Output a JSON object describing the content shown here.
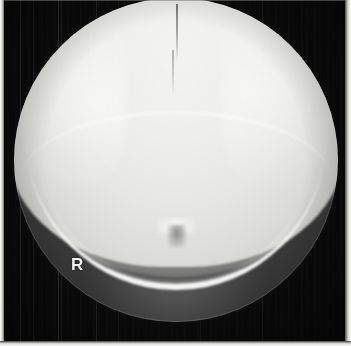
{
  "image": {
    "type": "radiograph",
    "modality": "X-ray",
    "view_description": "Skull radiograph, occipital / Towne's projection showing calvarium, posterior fossa and foramen magnum within a circular collimated field",
    "width_px": 351,
    "height_px": 346
  },
  "markers": {
    "laterality": {
      "label": "R",
      "meaning": "right-side-marker",
      "color": "#f2f2f2",
      "x_px": 78,
      "y_px": 268
    }
  },
  "field": {
    "collimation_shape": "circle",
    "center_x_px": 176,
    "center_y_px": 160,
    "radius_px": 162
  },
  "tones": {
    "background": "#0b0b0b",
    "film_edge": "#d9d9d6",
    "calvarium_bright": "#eeeeec",
    "posterior_fossa_mid": "#8a8a88",
    "lucency_dark": "#5a5a58",
    "bone_highlight": "#ffffff"
  },
  "anatomy": {
    "regions": [
      {
        "name": "calvarium",
        "label": "Cranial vault"
      },
      {
        "name": "sagittal-suture",
        "label": "Sagittal suture"
      },
      {
        "name": "posterior-fossa",
        "label": "Posterior fossa"
      },
      {
        "name": "foramen-magnum",
        "label": "Foramen magnum"
      },
      {
        "name": "petrous-ridge-left",
        "label": "Left petrous ridge"
      },
      {
        "name": "petrous-ridge-right",
        "label": "Right petrous ridge"
      },
      {
        "name": "occipital-arc",
        "label": "Occipital squama / skull base arc"
      },
      {
        "name": "soft-tissue-shadow",
        "label": "Soft tissue shadow"
      }
    ]
  }
}
